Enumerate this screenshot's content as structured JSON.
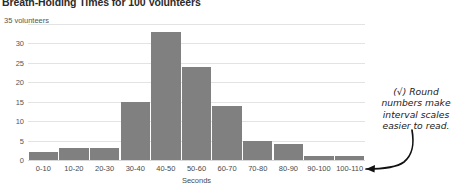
{
  "chart_data": {
    "type": "bar",
    "title": "Breath-Holding Times for 100 Volunteers",
    "xlabel": "Seconds",
    "ylabel": "35 volunteers",
    "categories": [
      "0-10",
      "10-20",
      "20-30",
      "30-40",
      "40-50",
      "50-60",
      "60-70",
      "70-80",
      "80-90",
      "90-100",
      "100-110"
    ],
    "values": [
      2,
      3,
      3,
      15,
      33,
      24,
      14,
      5,
      4,
      1,
      1
    ],
    "ylim": [
      0,
      35
    ],
    "yticks": [
      0,
      5,
      10,
      15,
      20,
      25,
      30,
      35
    ],
    "ytick_labels": [
      "0",
      "5",
      "10",
      "15",
      "20",
      "25",
      "30",
      "35 volunteers"
    ],
    "grid": true,
    "legend": "none",
    "bar_color": "#808080",
    "grid_color": "#e3e3e3",
    "annotations": [
      {
        "text": "(√) Round numbers make interval scales easier to read.",
        "lines": [
          "(√) Round",
          "numbers make",
          "interval scales",
          "easier to read."
        ],
        "points_to": "100-110"
      }
    ]
  },
  "chart": {
    "title": "Breath-Holding Times for 100 Volunteers",
    "y_axis_title": "35 volunteers",
    "x_axis_title": "Seconds"
  },
  "annotation": {
    "line1": "(√) Round",
    "line2": "numbers make",
    "line3": "interval scales",
    "line4": "easier to read."
  }
}
